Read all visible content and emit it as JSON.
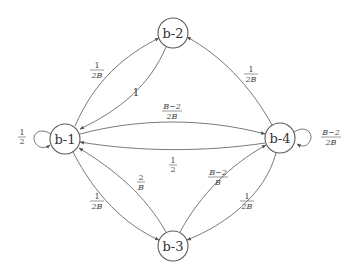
{
  "diagram": {
    "type": "state-transition-graph",
    "nodes": [
      {
        "id": "b-1",
        "label": "b-1",
        "cx": 65,
        "cy": 139
      },
      {
        "id": "b-2",
        "label": "b-2",
        "cx": 173,
        "cy": 33
      },
      {
        "id": "b-3",
        "label": "b-3",
        "cx": 173,
        "cy": 246
      },
      {
        "id": "b-4",
        "label": "b-4",
        "cx": 280,
        "cy": 138
      }
    ],
    "edges": [
      {
        "from": "b-1",
        "to": "b-1",
        "label": {
          "num": "1",
          "den": "2"
        }
      },
      {
        "from": "b-1",
        "to": "b-2",
        "label": {
          "num": "1",
          "den": "2B"
        }
      },
      {
        "from": "b-2",
        "to": "b-1",
        "label": {
          "text": "1"
        }
      },
      {
        "from": "b-1",
        "to": "b-4",
        "label": {
          "num": "B−2",
          "den": "2B"
        }
      },
      {
        "from": "b-4",
        "to": "b-1",
        "label": {
          "num": "1",
          "den": "2"
        }
      },
      {
        "from": "b-1",
        "to": "b-3",
        "label": {
          "num": "1",
          "den": "2B"
        }
      },
      {
        "from": "b-3",
        "to": "b-1",
        "label": {
          "num": "2",
          "den": "B"
        }
      },
      {
        "from": "b-4",
        "to": "b-2",
        "label": {
          "num": "1",
          "den": "2B"
        }
      },
      {
        "from": "b-4",
        "to": "b-4",
        "label": {
          "num": "B−2",
          "den": "2B"
        }
      },
      {
        "from": "b-3",
        "to": "b-4",
        "label": {
          "num": "B−2",
          "den": "B"
        }
      },
      {
        "from": "b-4",
        "to": "b-3",
        "label": {
          "num": "1",
          "den": "2B"
        }
      }
    ]
  }
}
